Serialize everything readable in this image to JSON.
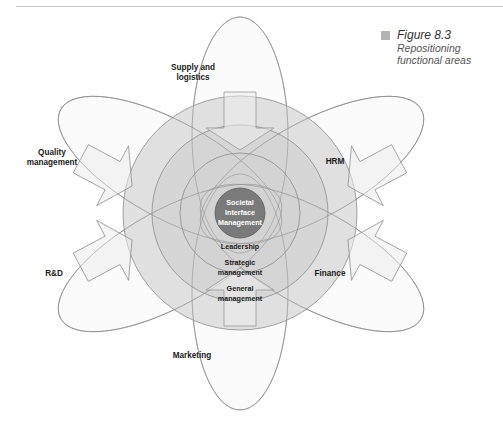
{
  "header": {
    "running_title": ""
  },
  "figure": {
    "number": "Figure 8.3",
    "title": "Repositioning functional areas",
    "title_lines": [
      "Repositioning",
      "functional areas"
    ]
  },
  "diagram": {
    "core": {
      "label_lines": [
        "Societal",
        "Interface",
        "Management"
      ],
      "color": "#7a7a7a"
    },
    "layers": [
      {
        "label_lines": [
          "Leadership"
        ]
      },
      {
        "label_lines": [
          "Strategic",
          "management"
        ]
      },
      {
        "label_lines": [
          "General",
          "management"
        ]
      }
    ],
    "functional_areas": [
      {
        "id": "supply",
        "label_lines": [
          "Supply and",
          "logistics"
        ],
        "position": "top"
      },
      {
        "id": "hrm",
        "label_lines": [
          "HRM"
        ],
        "position": "upper-right"
      },
      {
        "id": "finance",
        "label_lines": [
          "Finance"
        ],
        "position": "lower-right"
      },
      {
        "id": "marketing",
        "label_lines": [
          "Marketing"
        ],
        "position": "bottom"
      },
      {
        "id": "rnd",
        "label_lines": [
          "R&D"
        ],
        "position": "lower-left"
      },
      {
        "id": "quality",
        "label_lines": [
          "Quality",
          "management"
        ],
        "position": "upper-left"
      }
    ],
    "colors": {
      "outer_ring": "#d4d4d4",
      "middle_ring": "#c9c9c9",
      "inner_ring": "#cfcfcf",
      "ellipse_fill": "#f7f7f7",
      "stroke": "#8c8c8c",
      "core": "#7a7a7a"
    }
  }
}
